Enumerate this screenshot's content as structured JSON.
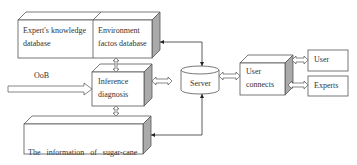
{
  "diagram": {
    "nodes": {
      "expert_db": {
        "line1": "Expert's knowledge",
        "line2": "database"
      },
      "env_db": {
        "line1": "Environment",
        "line2": "factos database"
      },
      "inference": {
        "line1": "Inference",
        "line2": "diagnosis"
      },
      "remote_info": {
        "line1": "The   information   of   sugar-cane",
        "line2": "monitoring based on remote sense"
      },
      "server": {
        "label": "Server"
      },
      "user_connects": {
        "line1": "User",
        "line2": "connects"
      },
      "user": {
        "label": "User"
      },
      "experts": {
        "label": "Experts"
      }
    },
    "input_arrow": {
      "label": "OoB"
    },
    "edges": [
      {
        "from": "env_db",
        "to": "inference",
        "type": "double-hollow"
      },
      {
        "from": "inference",
        "to": "remote_info",
        "type": "double-hollow"
      },
      {
        "from": "inference",
        "to": "server",
        "type": "double-hollow"
      },
      {
        "from": "server",
        "to": "user_connects",
        "type": "double-hollow"
      },
      {
        "from": "user_connects",
        "to": "user",
        "type": "double-hollow"
      },
      {
        "from": "user_connects",
        "to": "experts",
        "type": "double-hollow"
      },
      {
        "from": "server",
        "to": "env_db",
        "type": "line-arrow"
      },
      {
        "from": "server",
        "to": "remote_info",
        "type": "line-arrow"
      },
      {
        "from": "OoB",
        "to": "inference",
        "type": "hollow-arrow"
      }
    ]
  }
}
